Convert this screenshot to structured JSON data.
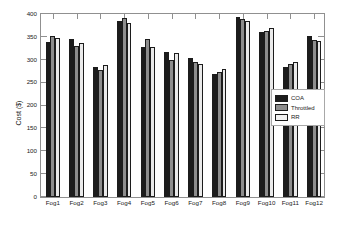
{
  "chart_data": {
    "type": "bar",
    "title": "",
    "subtitle": "",
    "xlabel": "",
    "ylabel": "Cost ($)",
    "categories": [
      "Fog1",
      "Fog2",
      "Fog3",
      "Fog4",
      "Fog5",
      "Fog6",
      "Fog7",
      "Fog8",
      "Fog9",
      "Fog10",
      "Fog11",
      "Fog12"
    ],
    "series": [
      {
        "name": "COA",
        "color": "#1c1c1c",
        "values": [
          335,
          341,
          282,
          380,
          324,
          313,
          300,
          266,
          390,
          357,
          281,
          348
        ]
      },
      {
        "name": "Throttled",
        "color": "#8d8d8d",
        "values": [
          349,
          326,
          275,
          388,
          341,
          297,
          292,
          270,
          385,
          360,
          288,
          340
        ]
      },
      {
        "name": "RR",
        "color": "#eaeaea",
        "values": [
          344,
          332,
          285,
          377,
          325,
          312,
          288,
          277,
          381,
          366,
          291,
          338
        ]
      }
    ],
    "ylim": [
      0,
      400
    ],
    "ytick_labels": [
      "0",
      "50",
      "100",
      "150",
      "200",
      "250",
      "300",
      "350",
      "400"
    ],
    "ytick_values": [
      0,
      50,
      100,
      150,
      200,
      250,
      300,
      350,
      400
    ],
    "grid": false,
    "legend_position": "center-right",
    "box": true
  },
  "legend": {
    "entries": [
      {
        "label": "COA"
      },
      {
        "label": "Throttled"
      },
      {
        "label": "RR"
      }
    ]
  }
}
